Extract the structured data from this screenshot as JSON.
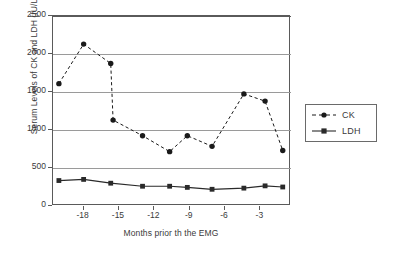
{
  "chart_data": {
    "type": "line",
    "title": "",
    "xlabel": "Months prior th the EMG",
    "ylabel": "Serum Levels of CK and LDH (IU/L)",
    "xlim": [
      -20.6,
      -0.4
    ],
    "ylim": [
      0,
      2500
    ],
    "grid": "horizontal",
    "legend_position": "right-outside",
    "yticks": [
      0,
      500,
      1000,
      1500,
      2000,
      2500
    ],
    "ytick_labels": [
      "0",
      "500",
      "1000",
      "1500",
      "2000",
      "2500"
    ],
    "xticks": [
      -18,
      -15,
      -12,
      -9,
      -6,
      -3
    ],
    "xtick_labels": [
      "-18",
      "-15",
      "-12",
      "-9",
      "-6",
      "-3"
    ],
    "series": [
      {
        "name": "CK",
        "style": "dashed",
        "marker": "circle",
        "color": "#1a1a1a",
        "x": [
          -20.1,
          -18.0,
          -15.7,
          -15.5,
          -13.0,
          -10.7,
          -9.2,
          -7.1,
          -4.4,
          -2.6,
          -1.1
        ],
        "values": [
          1610,
          2130,
          1875,
          1130,
          925,
          715,
          925,
          785,
          1475,
          1380,
          730
        ]
      },
      {
        "name": "LDH",
        "style": "solid",
        "marker": "square",
        "color": "#2a2a2a",
        "x": [
          -20.1,
          -18.0,
          -15.7,
          -13.0,
          -10.7,
          -9.2,
          -7.1,
          -4.4,
          -2.6,
          -1.1
        ],
        "values": [
          335,
          350,
          300,
          260,
          260,
          245,
          220,
          235,
          265,
          250
        ]
      }
    ]
  },
  "legend": {
    "entries": [
      {
        "label": "CK"
      },
      {
        "label": "LDH"
      }
    ]
  }
}
